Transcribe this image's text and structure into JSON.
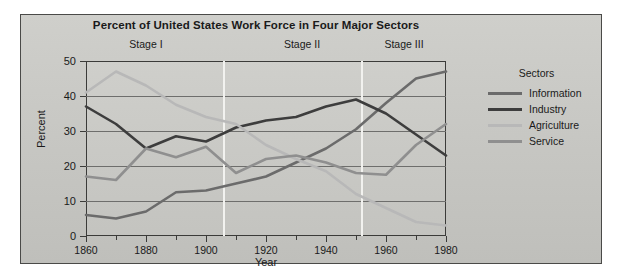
{
  "panel": {
    "background_color": "#c8c8c4",
    "border_color": "#4a4a48"
  },
  "title": "Percent of United States Work Force in Four Major Sectors",
  "stages": [
    {
      "label": "Stage I",
      "center_year": 1880
    },
    {
      "label": "Stage II",
      "center_year": 1932
    },
    {
      "label": "Stage III",
      "center_year": 1966
    }
  ],
  "legend": {
    "title": "Sectors",
    "items": [
      {
        "label": "Information",
        "color": "#6b6b6b"
      },
      {
        "label": "Industry",
        "color": "#3d3d3d"
      },
      {
        "label": "Agriculture",
        "color": "#b8b8b8"
      },
      {
        "label": "Service",
        "color": "#8f8f8f"
      }
    ]
  },
  "chart_data": {
    "type": "line",
    "title": "Percent of United States Work Force in Four Major Sectors",
    "xlabel": "Year",
    "ylabel": "Percent",
    "xlim": [
      1860,
      1980
    ],
    "ylim": [
      0,
      50
    ],
    "xticks": [
      1860,
      1880,
      1900,
      1920,
      1940,
      1960,
      1980
    ],
    "xtick_labels": [
      "1860",
      "1880",
      "1900",
      "1920",
      "1940",
      "1960",
      "1980"
    ],
    "yticks": [
      0,
      10,
      20,
      30,
      40,
      50
    ],
    "ytick_labels": [
      "0",
      "10",
      "20",
      "30",
      "40",
      "50"
    ],
    "grid": "horizontal",
    "legend_position": "right",
    "stage_dividers": [
      1906,
      1952
    ],
    "x": [
      1860,
      1870,
      1880,
      1890,
      1900,
      1910,
      1920,
      1930,
      1940,
      1950,
      1960,
      1970,
      1980
    ],
    "series": [
      {
        "name": "Information",
        "color": "#6b6b6b",
        "values": [
          6,
          5,
          7,
          12.5,
          13,
          15,
          17,
          21,
          25,
          30.5,
          38,
          45,
          47
        ]
      },
      {
        "name": "Industry",
        "color": "#3d3d3d",
        "values": [
          37,
          32,
          25,
          28.5,
          27,
          31,
          33,
          34,
          37,
          39,
          35,
          29,
          23
        ]
      },
      {
        "name": "Agriculture",
        "color": "#b8b8b8",
        "values": [
          41,
          47,
          43,
          37.5,
          34,
          32,
          26,
          22,
          18.5,
          12,
          8,
          4,
          3
        ]
      },
      {
        "name": "Service",
        "color": "#8f8f8f",
        "values": [
          17,
          16,
          25,
          22.5,
          25.5,
          18,
          22,
          23,
          21,
          18,
          17.5,
          26,
          32
        ]
      }
    ]
  }
}
